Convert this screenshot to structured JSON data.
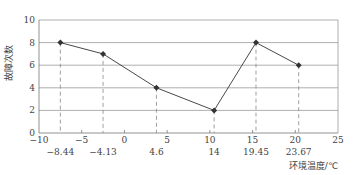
{
  "chart_data": {
    "type": "line",
    "title": "",
    "xlabel": "环境温度/℃",
    "ylabel": "故障次数",
    "xlim": [
      -10,
      25
    ],
    "ylim": [
      0,
      10
    ],
    "x_ticks": [
      -10,
      -5,
      0,
      5,
      10,
      15,
      20,
      25
    ],
    "x_tick_labels": [
      "−10",
      "−5",
      "0",
      "5",
      "10",
      "15",
      "20",
      "25"
    ],
    "y_ticks": [
      0,
      2,
      4,
      6,
      8,
      10
    ],
    "y_tick_labels": [
      "0",
      "2",
      "4",
      "6",
      "8",
      "10"
    ],
    "grid": "horizontal",
    "legend": "none",
    "series": [
      {
        "name": "故障次数",
        "x": [
          -8.44,
          -4.13,
          4.6,
          14,
          19.45,
          23.67
        ],
        "x_labels": [
          "−8.44",
          "−4.13",
          "4.6",
          "14",
          "19.45",
          "23.67"
        ],
        "values": [
          8,
          7,
          4,
          2,
          8,
          6
        ],
        "color": "#333333",
        "marker": "diamond"
      }
    ],
    "point_positions_on_axis": [
      -7.5,
      -2.5,
      2.5,
      7.5,
      12.5,
      17.5,
      22.5
    ]
  }
}
